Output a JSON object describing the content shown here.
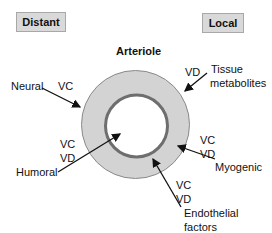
{
  "title": "Arteriole",
  "boxes": {
    "distant": "Distant",
    "local": "Local"
  },
  "labels": {
    "neural": {
      "name": "Neural",
      "effect": "VC"
    },
    "humoral": {
      "name": "Humoral",
      "effect1": "VC",
      "effect2": "VD"
    },
    "tissue_metabolites": {
      "name1": "Tissue",
      "name2": "metabolites",
      "effect": "VD"
    },
    "myogenic": {
      "name": "Myogenic",
      "effect1": "VC",
      "effect2": "VD"
    },
    "endothelial": {
      "name1": "Endothelial",
      "name2": "factors",
      "effect1": "VC",
      "effect2": "VD"
    }
  },
  "colors": {
    "vessel_wall": "#d3d3d3",
    "vessel_outline": "#8a8a8a",
    "endothelium": "#6e6e6e",
    "lumen": "#ffffff",
    "box_fill": "#d9d9d9"
  }
}
